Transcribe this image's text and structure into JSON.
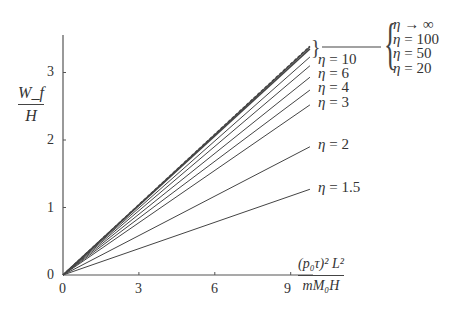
{
  "chart_data": {
    "type": "line",
    "title": "",
    "xlabel": "(p0 τ)^2 L^2 / (m M0 H)",
    "xlabel_numerator": "(p₀τ)² L²",
    "xlabel_denominator": "mM₀H",
    "ylabel": "W_f / H",
    "ylabel_numerator": "W_f",
    "ylabel_denominator": "H",
    "x_ticks": [
      0,
      3,
      6,
      9
    ],
    "y_ticks": [
      0,
      1,
      2,
      3
    ],
    "xlim": [
      0,
      9.8
    ],
    "ylim": [
      0,
      3.6
    ],
    "grid": false,
    "x": [
      0,
      9.76
    ],
    "series": [
      {
        "name": "η → ∞",
        "eta": "∞",
        "slope": 0.348,
        "values": [
          0,
          3.39
        ],
        "style": "dashed"
      },
      {
        "name": "η = 100",
        "eta": "100",
        "slope": 0.346,
        "values": [
          0,
          3.38
        ],
        "style": "solid"
      },
      {
        "name": "η = 50",
        "eta": "50",
        "slope": 0.343,
        "values": [
          0,
          3.35
        ],
        "style": "solid"
      },
      {
        "name": "η = 20",
        "eta": "20",
        "slope": 0.331,
        "values": [
          0,
          3.23
        ],
        "style": "solid"
      },
      {
        "name": "η = 10",
        "eta": "10",
        "slope": 0.317,
        "values": [
          0,
          3.1
        ],
        "style": "solid"
      },
      {
        "name": "η = 6",
        "eta": "6",
        "slope": 0.301,
        "values": [
          0,
          2.93
        ],
        "style": "solid"
      },
      {
        "name": "η = 4",
        "eta": "4",
        "slope": 0.281,
        "values": [
          0,
          2.74
        ],
        "style": "solid"
      },
      {
        "name": "η = 3",
        "eta": "3",
        "slope": 0.258,
        "values": [
          0,
          2.52
        ],
        "style": "solid"
      },
      {
        "name": "η = 2",
        "eta": "2",
        "slope": 0.194,
        "values": [
          0,
          1.9
        ],
        "style": "solid"
      },
      {
        "name": "η = 1.5",
        "eta": "1.5",
        "slope": 0.13,
        "values": [
          0,
          1.27
        ],
        "style": "solid"
      }
    ],
    "annotations": {
      "grouped_legend": [
        "η → ∞",
        "η = 100",
        "η = 50",
        "η = 20"
      ],
      "inline_labels": [
        "η = 10",
        "η = 6",
        "η = 4",
        "η = 3",
        "η = 2",
        "η = 1.5"
      ]
    }
  },
  "labels": {
    "eta": "η",
    "eq": " = ",
    "arrow": " → ",
    "inf": "∞",
    "brace": "{",
    "small_brace": "}",
    "x_ticks": [
      "0",
      "3",
      "6",
      "9"
    ],
    "y_ticks": [
      "0",
      "1",
      "2",
      "3"
    ],
    "group": [
      "100",
      "50",
      "20"
    ],
    "inline": [
      "10",
      "6",
      "4",
      "3",
      "2",
      "1.5"
    ]
  },
  "colors": {
    "axis": "#555555",
    "line": "#444444",
    "text": "#333333",
    "background": "#ffffff"
  }
}
